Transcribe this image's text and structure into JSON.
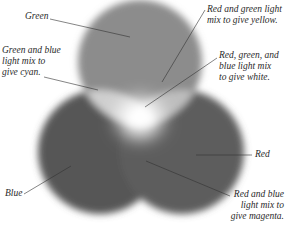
{
  "diagram": {
    "colors": {
      "background": "#ffffff",
      "green_circle": "#8a8a8a",
      "blue_circle": "#5a5a5a",
      "red_circle": "#606060",
      "overlap_cyan": "#c8c8c8",
      "overlap_yellow": "#b4b4b4",
      "overlap_magenta": "#5e5e5e",
      "center_white": "#ffffff",
      "leader_line": "#333333"
    },
    "circles": [
      {
        "name": "Green",
        "cx": 140,
        "cy": 62,
        "r": 62
      },
      {
        "name": "Blue",
        "cx": 100,
        "cy": 152,
        "r": 62
      },
      {
        "name": "Red",
        "cx": 182,
        "cy": 152,
        "r": 62
      }
    ],
    "labels": {
      "green": "Green",
      "cyan": "Green and blue\nlight mix to\ngive cyan.",
      "yellow": "Red and green light\nmix to give yellow.",
      "white": "Red, green, and\nblue light mix\nto give white.",
      "red": "Red",
      "blue": "Blue",
      "magenta": "Red and blue\nlight mix to\ngive magenta."
    }
  }
}
